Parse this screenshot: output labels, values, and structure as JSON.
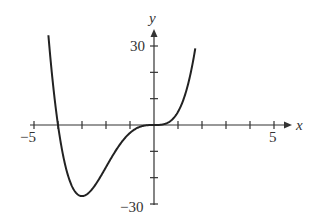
{
  "chart_data": {
    "type": "line",
    "title": "",
    "xlabel": "x",
    "ylabel": "y",
    "xlim": [
      -5,
      5
    ],
    "ylim": [
      -30,
      30
    ],
    "x_ticks": [
      -5,
      -4,
      -3,
      -2,
      -1,
      0,
      1,
      2,
      3,
      4,
      5
    ],
    "x_tick_labels": {
      "-5": "−5",
      "5": "5"
    },
    "y_ticks": [
      -30,
      -20,
      -10,
      0,
      10,
      20,
      30
    ],
    "y_tick_labels": {
      "30": "30",
      "-30": "−30"
    },
    "grid": false,
    "series": [
      {
        "name": "f(x) = x^3 (x + 4)",
        "x": [
          -4.4,
          -4.2,
          -4.0,
          -3.8,
          -3.5,
          -3.0,
          -2.5,
          -2.0,
          -1.5,
          -1.0,
          -0.5,
          0,
          0.5,
          1.0,
          1.3,
          1.5,
          1.7
        ],
        "y": [
          34.1,
          14.8,
          0,
          -11.0,
          -21.4,
          -27.0,
          -23.4,
          -16.0,
          -8.4,
          -3.0,
          -0.4,
          0,
          0.6,
          5.0,
          11.7,
          18.6,
          28.0
        ]
      }
    ]
  },
  "labels": {
    "x_axis": "x",
    "y_axis": "y",
    "x_min": "−5",
    "x_max": "5",
    "y_max": "30",
    "y_min": "−30"
  }
}
